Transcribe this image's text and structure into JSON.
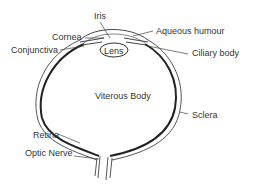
{
  "diagram": {
    "line_color": "#333333",
    "labels": {
      "iris": "Iris",
      "cornea": "Cornea",
      "conjunctiva": "Conjunctiva",
      "aqueous_humour": "Aqueous humour",
      "ciliary_body": "Ciliary body",
      "lens": "Lens",
      "vitreous_body": "Viterous Body",
      "sclera": "Sclera",
      "retina": "Retina",
      "optic_nerve": "Optic Nerve"
    }
  }
}
